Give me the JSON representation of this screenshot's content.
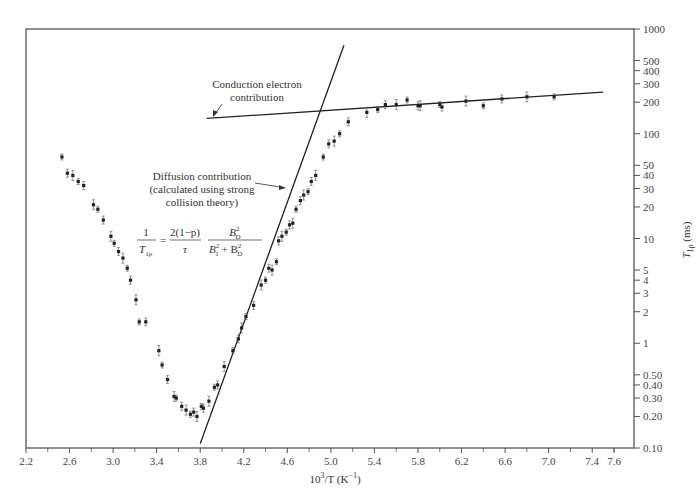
{
  "chart_data": {
    "type": "scatter",
    "title": "",
    "xlabel": "10^3/T (K^-1)",
    "ylabel": "T1ρ (ms)",
    "xlim": [
      2.2,
      7.78
    ],
    "ylim": [
      0.1,
      1000
    ],
    "yscale": "log",
    "grid": false,
    "x_ticks": [
      2.2,
      2.6,
      3.0,
      3.4,
      3.8,
      4.2,
      4.6,
      5.0,
      5.4,
      5.8,
      6.2,
      6.6,
      7.0,
      7.4,
      7.6
    ],
    "x_tick_labels": [
      "2.2",
      "2.6",
      "3.0",
      "3.4",
      "3.8",
      "4.2",
      "4.6",
      "5.0",
      "5.4",
      "5.8",
      "6.2",
      "6.6",
      "7.0",
      "7.4",
      "7.6"
    ],
    "y_ticks": [
      0.1,
      0.2,
      0.3,
      0.4,
      0.5,
      1,
      2,
      3,
      4,
      5,
      10,
      20,
      30,
      40,
      50,
      100,
      200,
      300,
      400,
      500,
      1000
    ],
    "y_tick_labels": [
      "0.10",
      "0.20",
      "0.30",
      "0.40",
      "0.50",
      "1",
      "2",
      "3",
      "4",
      "5",
      "10",
      "20",
      "30",
      "40",
      "50",
      "100",
      "200",
      "300",
      "400",
      "500",
      "1000"
    ],
    "series": [
      {
        "name": "Measured T1ρ",
        "style": "points-with-error-bars",
        "x": [
          2.53,
          2.58,
          2.63,
          2.68,
          2.73,
          2.82,
          2.86,
          2.91,
          2.98,
          3.01,
          3.05,
          3.09,
          3.13,
          3.16,
          3.21,
          3.24,
          3.3,
          3.42,
          3.45,
          3.5,
          3.56,
          3.58,
          3.63,
          3.67,
          3.71,
          3.74,
          3.77,
          3.81,
          3.83,
          3.88,
          3.93,
          3.96,
          4.02,
          4.1,
          4.15,
          4.18,
          4.22,
          4.29,
          4.36,
          4.4,
          4.43,
          4.46,
          4.5,
          4.52,
          4.55,
          4.59,
          4.62,
          4.65,
          4.68,
          4.72,
          4.75,
          4.79,
          4.82,
          4.86,
          4.93,
          4.98,
          5.03,
          5.08,
          5.16,
          5.33,
          5.43,
          5.5,
          5.6,
          5.7,
          5.8,
          5.82,
          6.0,
          6.02,
          6.24,
          6.4,
          6.57,
          6.8,
          7.05
        ],
        "y": [
          60,
          42,
          40,
          35,
          32,
          21,
          19,
          15,
          10.5,
          9,
          7.5,
          6.5,
          5.2,
          4.0,
          2.6,
          1.6,
          1.6,
          0.85,
          0.62,
          0.45,
          0.31,
          0.3,
          0.25,
          0.23,
          0.21,
          0.22,
          0.2,
          0.25,
          0.24,
          0.28,
          0.38,
          0.4,
          0.6,
          0.85,
          1.1,
          1.4,
          1.8,
          2.3,
          3.6,
          4.0,
          5.2,
          5.0,
          6.0,
          9.5,
          10.5,
          11.5,
          13.5,
          14,
          19,
          23,
          26,
          28,
          35,
          40,
          60,
          80,
          85,
          100,
          130,
          160,
          170,
          190,
          190,
          210,
          185,
          185,
          190,
          180,
          205,
          185,
          215,
          225,
          225
        ]
      },
      {
        "name": "Diffusion contribution",
        "style": "line",
        "x": [
          3.8,
          5.12
        ],
        "y": [
          0.11,
          700
        ]
      },
      {
        "name": "Conduction electron contribution",
        "style": "line",
        "x": [
          3.86,
          7.5
        ],
        "y": [
          140,
          250
        ]
      }
    ],
    "annotations": [
      {
        "text": "Conduction electron contribution",
        "lines": [
          "Conduction electron",
          "contribution"
        ],
        "arrow_to": [
          3.94,
          145
        ]
      },
      {
        "text": "Diffusion contribution (calculated using strong collision theory)",
        "lines": [
          "Diffusion contribution",
          "(calculated using strong",
          "collision theory)"
        ],
        "arrow_to": [
          4.72,
          25
        ]
      },
      {
        "text": "1/T1ρ = 2(1−p)/τ · B_D^2/(B_1^2 + B_D^2)",
        "type": "equation"
      }
    ],
    "legend": "none"
  },
  "labels": {
    "xlabel_main": "10",
    "xlabel_sup": "3",
    "xlabel_rest": "/T (K",
    "xlabel_sup2": "−1",
    "xlabel_end": ")",
    "ylabel": "T",
    "ylabel_sub": "1ρ",
    "ylabel_unit": " (ms)",
    "ann_conduction_1": "Conduction electron",
    "ann_conduction_2": "contribution",
    "ann_diffusion_1": "Diffusion contribution",
    "ann_diffusion_2": "(calculated using strong",
    "ann_diffusion_3": "collision theory)",
    "eq_one": "1",
    "eq_T": "T",
    "eq_T_sub": "1ρ",
    "eq_eq": "=",
    "eq_num2": "2(1−p)",
    "eq_tau": "τ",
    "eq_BD": "B",
    "eq_BD_sup": "2",
    "eq_BD_sub": "D",
    "eq_den": "B",
    "eq_den_sup1": "2",
    "eq_den_sub1": "1",
    "eq_plus": " + B",
    "eq_den_sup2": "2",
    "eq_den_sub2": "D"
  },
  "colors": {
    "axis": "#555555",
    "points": "#222222",
    "lines": "#222222",
    "text": "#333333"
  }
}
